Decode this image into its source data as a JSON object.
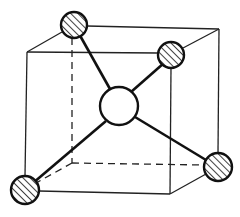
{
  "diagram": {
    "type": "tetrahedral-coordination-in-cube",
    "cube": {
      "front_face": {
        "x1": 27,
        "y1": 52,
        "x2": 170,
        "y2": 193
      },
      "back_face": {
        "x1": 72,
        "y1": 29,
        "x2": 219,
        "y2": 163
      },
      "hidden_corner": {
        "x": 72,
        "y": 163
      }
    },
    "central_atom": {
      "cx": 119,
      "cy": 106,
      "r": 19,
      "fill": "#ffffff",
      "hatched": false
    },
    "corner_atoms": [
      {
        "name": "back-top-left",
        "cx": 74,
        "cy": 25,
        "r": 13
      },
      {
        "name": "front-top-right",
        "cx": 171,
        "cy": 55,
        "r": 13
      },
      {
        "name": "front-bottom-left",
        "cx": 25,
        "cy": 190,
        "r": 14
      },
      {
        "name": "back-bottom-right",
        "cx": 218,
        "cy": 167,
        "r": 14
      }
    ],
    "colors": {
      "line": "#222222",
      "background": "#ffffff"
    }
  }
}
